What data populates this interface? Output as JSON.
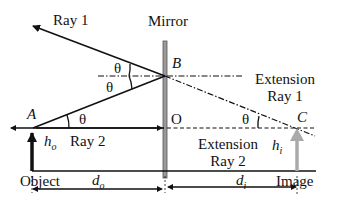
{
  "diagram": {
    "labels": {
      "ray1_incident": "Ray 1",
      "mirror": "Mirror",
      "point_b": "B",
      "extension_ray1_line1": "Extension",
      "extension_ray1_line2": "Ray 1",
      "point_a": "A",
      "theta_top": "θ",
      "theta_bottom": "θ",
      "theta_a": "θ",
      "theta_c": "θ",
      "point_o": "O",
      "point_c": "C",
      "ray2": "Ray 2",
      "ho_main": "h",
      "ho_sub": "o",
      "hi_main": "h",
      "hi_sub": "i",
      "extension_ray2_line1": "Extension",
      "extension_ray2_line2": "Ray 2",
      "object": "Object",
      "do_main": "d",
      "do_sub": "o",
      "di_main": "d",
      "di_sub": "i",
      "image": "Image"
    },
    "colors": {
      "line": "#111111",
      "mirror_fill": "#9a9a9a",
      "mirror_stroke": "#555555",
      "image_arrow": "#aaaaaa"
    }
  }
}
